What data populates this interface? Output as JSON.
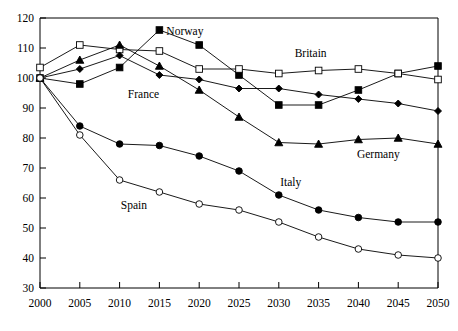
{
  "chart_data": {
    "type": "line",
    "title": "",
    "subtitle": "",
    "xlabel": "",
    "ylabel": "",
    "x": [
      2000,
      2005,
      2010,
      2015,
      2020,
      2025,
      2030,
      2035,
      2040,
      2045,
      2050
    ],
    "categories": [
      "2000",
      "2005",
      "2010",
      "2015",
      "2020",
      "2025",
      "2030",
      "2035",
      "2040",
      "2045",
      "2050"
    ],
    "xlim": [
      2000,
      2050
    ],
    "ylim": [
      30,
      120
    ],
    "yticks": [
      30,
      40,
      50,
      60,
      70,
      80,
      90,
      100,
      110,
      120
    ],
    "ytick_labels": [
      "30",
      "40",
      "50",
      "60",
      "70",
      "80",
      "90",
      "100",
      "110",
      "120"
    ],
    "xticks": [
      2000,
      2005,
      2010,
      2015,
      2020,
      2025,
      2030,
      2035,
      2040,
      2045,
      2050
    ],
    "xtick_labels": [
      "2000",
      "2005",
      "2010",
      "2015",
      "2020",
      "2025",
      "2030",
      "2035",
      "2040",
      "2045",
      "2050"
    ],
    "grid": false,
    "legend_position": "inline-annotations",
    "series": [
      {
        "name": "Norway",
        "marker": "filled-square",
        "values": [
          100,
          98,
          103.5,
          116,
          111,
          101,
          91,
          91,
          96,
          101.5,
          104
        ]
      },
      {
        "name": "Britain",
        "marker": "open-square",
        "values": [
          103.5,
          111,
          109.5,
          109,
          103,
          103,
          101.5,
          102.5,
          103,
          101.5,
          99.5
        ]
      },
      {
        "name": "France",
        "marker": "filled-diamond",
        "values": [
          100,
          103,
          107.5,
          101,
          99.5,
          96.5,
          96.5,
          94.5,
          93,
          91.5,
          89
        ]
      },
      {
        "name": "Germany",
        "marker": "filled-triangle",
        "values": [
          100,
          106,
          111,
          104,
          96,
          87,
          78.5,
          78,
          79.5,
          80,
          78
        ]
      },
      {
        "name": "Italy",
        "marker": "filled-circle",
        "values": [
          100,
          84,
          78,
          77.5,
          74,
          69,
          61,
          56,
          53.5,
          52,
          52
        ]
      },
      {
        "name": "Spain",
        "marker": "open-circle",
        "values": [
          100,
          81,
          66,
          62,
          58,
          56,
          52,
          47,
          43,
          41,
          40
        ]
      }
    ],
    "annotations": [
      {
        "text": "Norway",
        "x": 2018.2,
        "y": 114.5
      },
      {
        "text": "Britain",
        "x": 2034.0,
        "y": 107.0
      },
      {
        "text": "France",
        "x": 2013.0,
        "y": 93.5
      },
      {
        "text": "Germany",
        "x": 2042.5,
        "y": 73.5
      },
      {
        "text": "Italy",
        "x": 2031.5,
        "y": 64.0
      },
      {
        "text": "Spain",
        "x": 2011.8,
        "y": 56.5
      }
    ]
  }
}
